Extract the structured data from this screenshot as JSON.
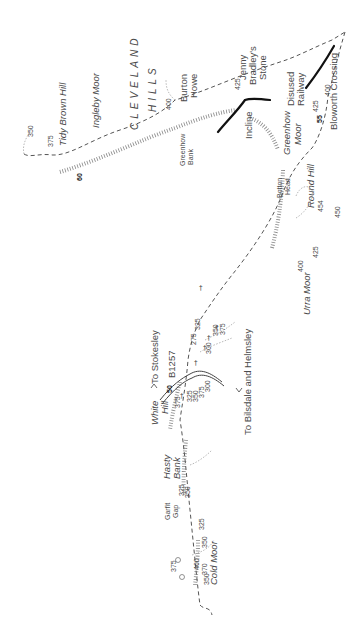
{
  "map": {
    "orientation": "rotated-90-ccw",
    "colors": {
      "background": "#ffffff",
      "text": "#4a4a4a",
      "path": "#555555",
      "railway": "#111111",
      "hachure": "#888888"
    },
    "places": {
      "tidy_brown_hill": "Tidy Brown Hill",
      "ingleby_moor": "Ingleby Moor",
      "cleveland": "CLEVELAND",
      "hills": "HILLS",
      "greenhow": "Greenhow",
      "bank": "Bank",
      "burton": "Burton",
      "howe": "Howe",
      "incline": "Incline",
      "jenny": "Jenny",
      "bradleys": "Bradley's",
      "stone": "Stone",
      "greenhow_moor_1": "Greenhow",
      "greenhow_moor_2": "Moor",
      "disused": "Disused",
      "railway": "Railway",
      "bloworth_crossing": "Bloworth Crossing",
      "botton": "Botton",
      "head": "Head",
      "round_hill": "Round Hill",
      "urra_moor": "Urra Moor",
      "white": "White",
      "hill": "Hill",
      "to_stokesley": "To Stokesley",
      "b1257": "B1257",
      "to_bilsdale": "To Bilsdale and Helmsley",
      "hasty": "Hasty",
      "hasty_bank": "Bank",
      "garfit": "Garfit",
      "gap": "Gap",
      "cold_moor": "Cold Moor"
    },
    "markers": {
      "m60": "60",
      "m55": "55",
      "m50": "50"
    },
    "heights": {
      "h350a": "350",
      "h375a": "375",
      "h400a": "400",
      "h425a": "425",
      "h425b": "425",
      "h400b": "400",
      "h454": "454",
      "h450": "450",
      "h425c": "425",
      "h400c": "400",
      "h325a": "325",
      "h375b": "375",
      "h300a": "300",
      "h350b": "350",
      "h375c": "375",
      "h325b": "325",
      "h350c": "350",
      "h375d": "375",
      "h300b": "300",
      "h275": "275",
      "h325c": "325",
      "h350d": "350",
      "h325d": "325",
      "h350e": "350",
      "h375e": "375",
      "h400d": "400",
      "h370": "370",
      "h350f": "350"
    }
  }
}
